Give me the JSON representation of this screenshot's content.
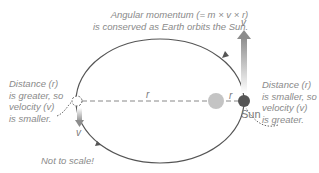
{
  "title": {
    "line1": "Angular momentum (= m × v × r)",
    "line2": "is conserved as Earth orbits the Sun."
  },
  "left_note": {
    "lines": [
      "Distance (r)",
      "is greater, so",
      "velocity (v)",
      "is smaller."
    ]
  },
  "right_note": {
    "lines": [
      "Distance (r)",
      "is smaller, so",
      "velocity (v)",
      "is greater."
    ]
  },
  "scale_note": "Not to scale!",
  "sun_label": "Sun",
  "symbols": {
    "r_left": "r",
    "r_right": "r",
    "v_top": "v",
    "v_bottom": "v"
  },
  "colors": {
    "orbit": "#555555",
    "sun": "#c4c4c4",
    "earth_perihelion": "#555555",
    "earth_aphelion": "#ffffff",
    "arrow": "#999999",
    "text": "#8a8a8a"
  }
}
